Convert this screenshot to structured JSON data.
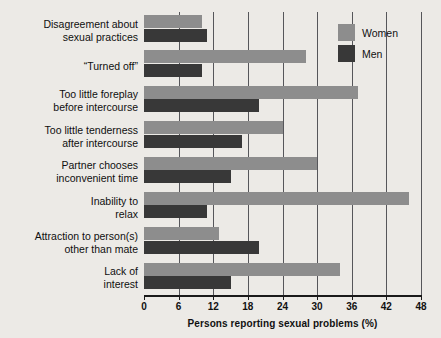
{
  "chart_data": {
    "type": "bar",
    "orientation": "horizontal",
    "title": "",
    "xlabel": "Persons reporting sexual problems (%)",
    "ylabel": "",
    "xlim": [
      0,
      48
    ],
    "xticks": [
      0,
      6,
      12,
      18,
      24,
      30,
      36,
      42,
      48
    ],
    "grid": true,
    "legend_position": "top-right",
    "categories": [
      "Disagreement about sexual practices",
      "“Turned off”",
      "Too little foreplay before intercourse",
      "Too little tenderness after intercourse",
      "Partner chooses inconvenient time",
      "Inability to relax",
      "Attraction to person(s) other than mate",
      "Lack of interest"
    ],
    "category_lines": [
      [
        "Disagreement about",
        "sexual practices"
      ],
      [
        "“Turned off”"
      ],
      [
        "Too little foreplay",
        "before intercourse"
      ],
      [
        "Too little tenderness",
        "after intercourse"
      ],
      [
        "Partner chooses",
        "inconvenient time"
      ],
      [
        "Inability to",
        "relax"
      ],
      [
        "Attraction to person(s)",
        "other than mate"
      ],
      [
        "Lack of",
        "interest"
      ]
    ],
    "series": [
      {
        "name": "Women",
        "color": "#8d8d8d",
        "values": [
          10,
          28,
          37,
          24,
          30,
          46,
          13,
          34
        ]
      },
      {
        "name": "Men",
        "color": "#383838",
        "values": [
          11,
          10,
          20,
          17,
          15,
          11,
          20,
          15
        ]
      }
    ]
  },
  "legend": {
    "items": [
      {
        "label": "Women",
        "color": "#8d8d8d"
      },
      {
        "label": "Men",
        "color": "#383838"
      }
    ]
  },
  "colors": {
    "background": "#eceae6",
    "women": "#8d8d8d",
    "men": "#383838",
    "grid": "#56565a",
    "axis": "#1a1a1a",
    "text": "#111111"
  }
}
